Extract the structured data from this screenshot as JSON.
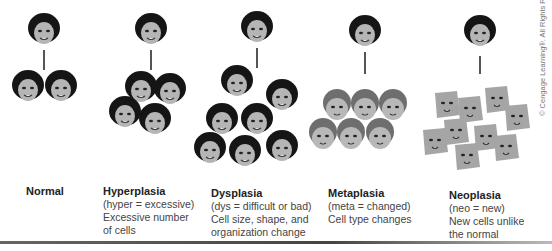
{
  "stages": [
    {
      "title": "Normal",
      "lines": []
    },
    {
      "title": "Hyperplasia",
      "lines": [
        "(hyper = excessive)",
        "Excessive number",
        "of cells"
      ]
    },
    {
      "title": "Dysplasia",
      "lines": [
        "(dys = difficult or bad)",
        "Cell size, shape, and",
        "organization change"
      ]
    },
    {
      "title": "Metaplasia",
      "lines": [
        "(meta = changed)",
        "Cell type changes"
      ]
    },
    {
      "title": "Neoplasia",
      "lines": [
        "(neo = new)",
        "New cells unlike",
        "the normal"
      ]
    }
  ],
  "copyright": "© Cengage Learning®. All Rights Reserved.",
  "colors": {
    "hair": "#1a1a1a",
    "skin": "#b0b0b0",
    "meta_hair": "#6a6a6a",
    "neo_skin": "#a8a8a8"
  }
}
